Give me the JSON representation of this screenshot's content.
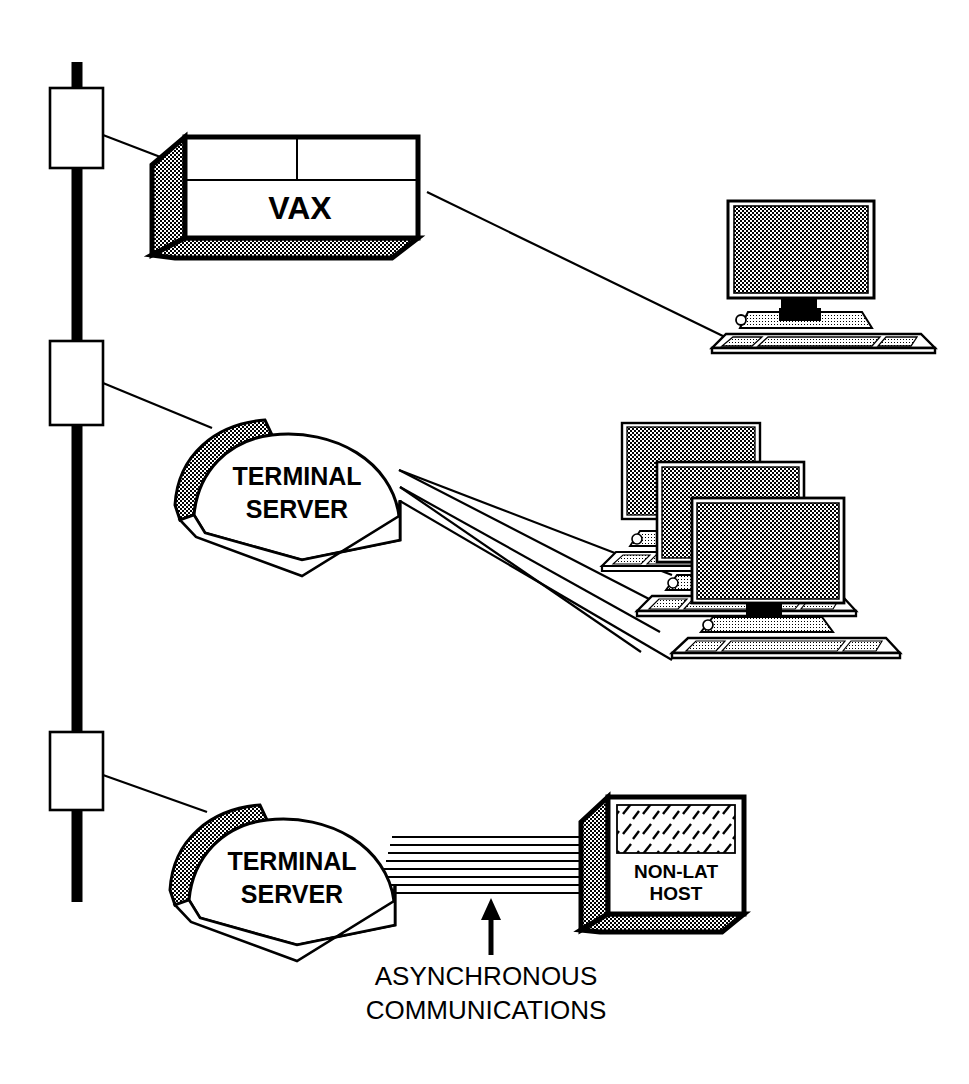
{
  "diagram": {
    "background_color": "#ffffff",
    "ink_color": "#000000",
    "halftone_color": "#9a9a9a",
    "width": 969,
    "height": 1084
  },
  "backbone": {
    "name": "ethernet-backbone",
    "label": "",
    "orientation": "vertical",
    "color": "#000000"
  },
  "taps": [
    {
      "id": "tap-1",
      "label": "",
      "connects_to": "VAX"
    },
    {
      "id": "tap-2",
      "label": "",
      "connects_to": "TERMINAL SERVER"
    },
    {
      "id": "tap-3",
      "label": "",
      "connects_to": "TERMINAL SERVER"
    }
  ],
  "nodes": {
    "vax": {
      "name": "vax-host",
      "label": "VAX",
      "shape": "3d-box"
    },
    "terminal_server_upper": {
      "name": "terminal-server-upper",
      "label_line1": "TERMINAL",
      "label_line2": "SERVER",
      "shape": "dome"
    },
    "terminal_server_lower": {
      "name": "terminal-server-lower",
      "label_line1": "TERMINAL",
      "label_line2": "SERVER",
      "shape": "dome"
    },
    "non_lat_host": {
      "name": "non-lat-host",
      "label_line1": "NON-LAT",
      "label_line2": "HOST",
      "shape": "3d-cube"
    }
  },
  "terminals": {
    "single": {
      "name": "terminal-single",
      "count": 1,
      "label": ""
    },
    "cluster": {
      "name": "terminal-cluster",
      "count": 3,
      "label": ""
    }
  },
  "links": [
    {
      "id": "link-tap1-vax",
      "style": "single-line",
      "label": ""
    },
    {
      "id": "link-vax-terminal",
      "style": "single-line",
      "label": ""
    },
    {
      "id": "link-tap2-ts-upper",
      "style": "single-line",
      "label": ""
    },
    {
      "id": "link-ts-upper-terminals",
      "style": "three-lines",
      "label": ""
    },
    {
      "id": "link-tap3-ts-lower",
      "style": "single-line",
      "label": ""
    },
    {
      "id": "link-ts-lower-nonlat",
      "style": "cable-bundle",
      "label": ""
    }
  ],
  "annotation": {
    "name": "asynchronous-communications-annotation",
    "line1": "ASYNCHRONOUS",
    "line2": "COMMUNICATIONS",
    "arrow": "up-arrow",
    "points_to": "cable-bundle"
  }
}
